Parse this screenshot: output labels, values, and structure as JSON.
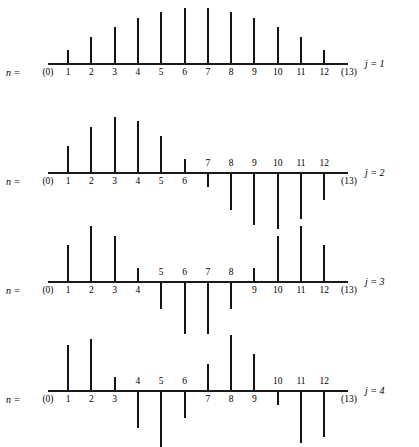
{
  "figure": {
    "index_label": "n =",
    "background_color": "#ffffff",
    "stem_color": "#141414",
    "axis_color": "#1a1a1a",
    "endpoint_labels": [
      "(0)",
      "(13)"
    ],
    "tick_labels": [
      "1",
      "2",
      "3",
      "4",
      "5",
      "6",
      "7",
      "8",
      "9",
      "10",
      "11",
      "12"
    ]
  },
  "chart_data": {
    "type": "stem",
    "title": "",
    "xlabel": "n",
    "ylabel": "",
    "grid": false,
    "legend": "right",
    "x": [
      1,
      2,
      3,
      4,
      5,
      6,
      7,
      8,
      9,
      10,
      11,
      12
    ],
    "x_endpoints": [
      0,
      13
    ],
    "ylim": [
      -1,
      1
    ],
    "panels": [
      {
        "label": "j = 1",
        "j": 1,
        "n_label": "n =",
        "end_left": "(0)",
        "end_right": "(13)",
        "categories": [
          "1",
          "2",
          "3",
          "4",
          "5",
          "6",
          "7",
          "8",
          "9",
          "10",
          "11",
          "12"
        ],
        "values": [
          0.239,
          0.464,
          0.663,
          0.823,
          0.935,
          0.993,
          0.993,
          0.935,
          0.823,
          0.663,
          0.464,
          0.239
        ],
        "label_side": [
          "below",
          "below",
          "below",
          "below",
          "below",
          "below",
          "below",
          "below",
          "below",
          "below",
          "below",
          "below"
        ]
      },
      {
        "label": "j = 2",
        "j": 2,
        "n_label": "n =",
        "end_left": "(0)",
        "end_right": "(13)",
        "categories": [
          "1",
          "2",
          "3",
          "4",
          "5",
          "6",
          "7",
          "8",
          "9",
          "10",
          "11",
          "12"
        ],
        "values": [
          0.464,
          0.823,
          0.993,
          0.935,
          0.663,
          0.239,
          -0.239,
          -0.663,
          -0.935,
          -0.993,
          -0.823,
          -0.464
        ],
        "label_side": [
          "below",
          "below",
          "below",
          "below",
          "below",
          "below",
          "above",
          "above",
          "above",
          "above",
          "above",
          "above"
        ]
      },
      {
        "label": "j = 3",
        "j": 3,
        "n_label": "n =",
        "end_left": "(0)",
        "end_right": "(13)",
        "categories": [
          "1",
          "2",
          "3",
          "4",
          "5",
          "6",
          "7",
          "8",
          "9",
          "10",
          "11",
          "12"
        ],
        "values": [
          0.663,
          0.993,
          0.823,
          0.239,
          -0.464,
          -0.935,
          -0.935,
          -0.464,
          0.239,
          0.823,
          0.993,
          0.663
        ],
        "label_side": [
          "below",
          "below",
          "below",
          "below",
          "above",
          "above",
          "above",
          "above",
          "below",
          "below",
          "below",
          "below"
        ]
      },
      {
        "label": "j = 4",
        "j": 4,
        "n_label": "n =",
        "end_left": "(0)",
        "end_right": "(13)",
        "categories": [
          "1",
          "2",
          "3",
          "4",
          "5",
          "6",
          "7",
          "8",
          "9",
          "10",
          "11",
          "12"
        ],
        "values": [
          0.823,
          0.935,
          0.239,
          -0.663,
          -0.993,
          -0.464,
          0.464,
          0.993,
          0.663,
          -0.239,
          -0.935,
          -0.823
        ],
        "label_side": [
          "below",
          "below",
          "below",
          "above",
          "above",
          "above",
          "below",
          "below",
          "below",
          "above",
          "above",
          "above"
        ]
      }
    ]
  }
}
